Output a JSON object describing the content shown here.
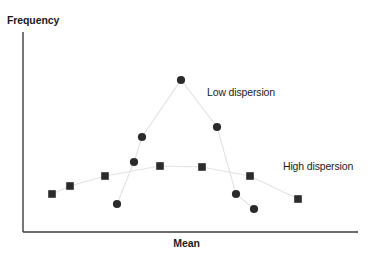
{
  "figure": {
    "width": 373,
    "height": 262,
    "background": "#ffffff"
  },
  "axes": {
    "y_title": "Frequency",
    "x_title": "Mean",
    "line_color": "#3b3b3b",
    "origin_x": 23,
    "origin_y": 232,
    "top_y": 32,
    "right_x": 358
  },
  "annotations": {
    "low": "Low dispersion",
    "high": "High dispersion"
  },
  "style": {
    "marker_color": "#2b2b2b",
    "connector_color": "#e2e2e2",
    "text_color": "#1b1b1b"
  },
  "chart_data": {
    "type": "scatter",
    "title": "",
    "xlabel": "Mean",
    "ylabel": "Frequency",
    "grid": false,
    "legend": "inline-annotations",
    "xlim": [
      23,
      358
    ],
    "ylim": [
      32,
      232
    ],
    "note": "Two overlaid distributions of sample means: a peaked low-dispersion series (circles) and a flat high-dispersion series (squares). Axes are unlabeled/unscaled; values below are pixel coordinates of plotted markers.",
    "series": [
      {
        "name": "Low dispersion",
        "marker": "circle",
        "connected": true,
        "points": [
          {
            "x": 117,
            "y": 204
          },
          {
            "x": 134,
            "y": 162
          },
          {
            "x": 142,
            "y": 137
          },
          {
            "x": 181,
            "y": 80
          },
          {
            "x": 217,
            "y": 127
          },
          {
            "x": 236,
            "y": 194
          },
          {
            "x": 254,
            "y": 209
          }
        ]
      },
      {
        "name": "High dispersion",
        "marker": "square",
        "connected": true,
        "points": [
          {
            "x": 52,
            "y": 194
          },
          {
            "x": 70,
            "y": 186
          },
          {
            "x": 105,
            "y": 176
          },
          {
            "x": 160,
            "y": 166
          },
          {
            "x": 202,
            "y": 167
          },
          {
            "x": 250,
            "y": 176
          },
          {
            "x": 298,
            "y": 199
          }
        ]
      }
    ]
  }
}
